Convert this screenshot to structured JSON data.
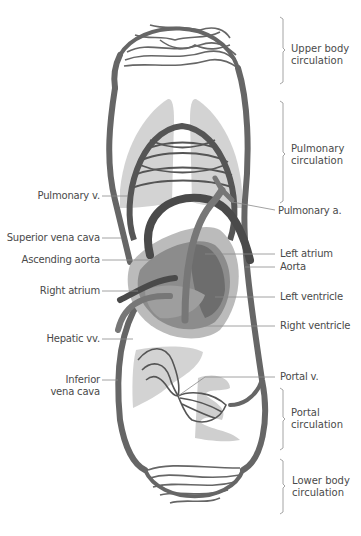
{
  "figure": {
    "colors": {
      "vessel": "#666666",
      "vessel_dark": "#4e4e4e",
      "organ_fill": "#d0d0d0",
      "heart_outer": "#b9b9b9",
      "heart_inner": "#8d8d8d",
      "label_text": "#4a4a4a",
      "leader_line": "#8a8a8a"
    }
  },
  "labels_left": [
    {
      "id": "pulmonary-v",
      "text": "Pulmonary v."
    },
    {
      "id": "superior-vena-cava",
      "text": "Superior vena cava"
    },
    {
      "id": "ascending-aorta",
      "text": "Ascending aorta"
    },
    {
      "id": "right-atrium",
      "text": "Right atrium"
    },
    {
      "id": "hepatic-vv",
      "text": "Hepatic vv."
    },
    {
      "id": "inferior-vena-cava",
      "line1": "Inferior",
      "line2": "vena cava"
    }
  ],
  "labels_right": [
    {
      "id": "pulmonary-a",
      "text": "Pulmonary a."
    },
    {
      "id": "left-atrium",
      "text": "Left atrium"
    },
    {
      "id": "aorta",
      "text": "Aorta"
    },
    {
      "id": "left-ventricle",
      "text": "Left ventricle"
    },
    {
      "id": "right-ventricle",
      "text": "Right ventricle"
    },
    {
      "id": "portal-v",
      "text": "Portal v."
    }
  ],
  "circulation_groups": [
    {
      "id": "upper-body",
      "line1": "Upper body",
      "line2": "circulation"
    },
    {
      "id": "pulmonary",
      "line1": "Pulmonary",
      "line2": "circulation"
    },
    {
      "id": "portal",
      "line1": "Portal",
      "line2": "circulation"
    },
    {
      "id": "lower-body",
      "line1": "Lower body",
      "line2": "circulation"
    }
  ]
}
